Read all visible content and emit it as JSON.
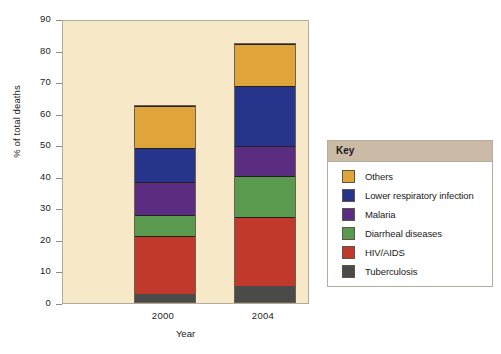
{
  "chart_data": {
    "type": "bar",
    "stacked": true,
    "title": "",
    "xlabel": "Year",
    "ylabel": "% of total deaths",
    "categories": [
      "2000",
      "2004"
    ],
    "ylim": [
      0,
      90
    ],
    "yticks": [
      90,
      80,
      70,
      60,
      50,
      40,
      30,
      20,
      10,
      0
    ],
    "grid": false,
    "legend_position": "right",
    "legend_title": "Key",
    "series": [
      {
        "name": "Tuberculosis",
        "color": "#4a4a48",
        "values": [
          2.5,
          5.0
        ]
      },
      {
        "name": "HIV/AIDS",
        "color": "#c0392b",
        "values": [
          18.5,
          22.0
        ]
      },
      {
        "name": "Diarrheal diseases",
        "color": "#5a9a4e",
        "values": [
          6.7,
          12.8
        ]
      },
      {
        "name": "Malaria",
        "color": "#5b2d82",
        "values": [
          10.3,
          9.6
        ]
      },
      {
        "name": "Lower respiratory infection",
        "color": "#27348b",
        "values": [
          10.7,
          19.0
        ]
      },
      {
        "name": "Others",
        "color": "#e0a53a",
        "values": [
          13.3,
          13.3
        ]
      }
    ],
    "totals": [
      62.0,
      81.7
    ],
    "legend_order": [
      "Others",
      "Lower respiratory infection",
      "Malaria",
      "Diarrheal diseases",
      "HIV/AIDS",
      "Tuberculosis"
    ],
    "plot_background": "#f7e8c8"
  }
}
